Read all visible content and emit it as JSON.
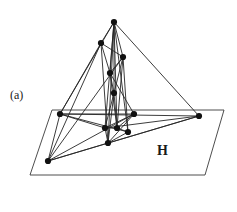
{
  "figure": {
    "caption_label": "(a)",
    "plane_label": "H",
    "title": "",
    "colors": {
      "stroke": "#262626",
      "node_fill": "#111111",
      "plane_stroke": "#3a3a3a",
      "background": "#ffffff",
      "text": "#1a1a1a"
    },
    "style": {
      "edge_width": 0.9,
      "plane_width": 0.9,
      "node_radius": 3.1
    },
    "canvas": {
      "width": 237,
      "height": 212
    },
    "plane": {
      "name": "H",
      "corners": [
        [
          52,
          110
        ],
        [
          224,
          110
        ],
        [
          205,
          175
        ],
        [
          30,
          175
        ]
      ]
    },
    "nodes": [
      {
        "id": "n0",
        "name": "apex",
        "x": 114,
        "y": 22,
        "on_plane": false
      },
      {
        "id": "n1",
        "name": "upper-left",
        "x": 101,
        "y": 43,
        "on_plane": false
      },
      {
        "id": "n2",
        "name": "upper-right",
        "x": 123,
        "y": 57,
        "on_plane": false
      },
      {
        "id": "n3",
        "name": "mid-upper",
        "x": 110,
        "y": 73,
        "on_plane": false
      },
      {
        "id": "n4",
        "name": "mid-lower",
        "x": 114,
        "y": 93,
        "on_plane": false
      },
      {
        "id": "n5",
        "name": "plane-left",
        "x": 60,
        "y": 114,
        "on_plane": true
      },
      {
        "id": "n6",
        "name": "plane-center",
        "x": 134,
        "y": 114,
        "on_plane": true
      },
      {
        "id": "n7",
        "name": "plane-right",
        "x": 199,
        "y": 116,
        "on_plane": true
      },
      {
        "id": "n8",
        "name": "cluster-left",
        "x": 105,
        "y": 128,
        "on_plane": true
      },
      {
        "id": "n9",
        "name": "cluster-mid",
        "x": 117,
        "y": 128,
        "on_plane": true
      },
      {
        "id": "n10",
        "name": "cluster-right",
        "x": 128,
        "y": 132,
        "on_plane": true
      },
      {
        "id": "n11",
        "name": "cluster-bottom",
        "x": 108,
        "y": 143,
        "on_plane": true
      },
      {
        "id": "n12",
        "name": "plane-lower-left",
        "x": 48,
        "y": 161,
        "on_plane": true
      }
    ],
    "edges": [
      [
        "n0",
        "n1"
      ],
      [
        "n0",
        "n2"
      ],
      [
        "n0",
        "n3"
      ],
      [
        "n0",
        "n4"
      ],
      [
        "n0",
        "n8"
      ],
      [
        "n0",
        "n9"
      ],
      [
        "n0",
        "n10"
      ],
      [
        "n0",
        "n11"
      ],
      [
        "n0",
        "n5"
      ],
      [
        "n0",
        "n7"
      ],
      [
        "n1",
        "n2"
      ],
      [
        "n1",
        "n3"
      ],
      [
        "n1",
        "n5"
      ],
      [
        "n1",
        "n11"
      ],
      [
        "n1",
        "n12"
      ],
      [
        "n2",
        "n3"
      ],
      [
        "n2",
        "n4"
      ],
      [
        "n2",
        "n9"
      ],
      [
        "n2",
        "n10"
      ],
      [
        "n2",
        "n12"
      ],
      [
        "n3",
        "n4"
      ],
      [
        "n3",
        "n9"
      ],
      [
        "n3",
        "n6"
      ],
      [
        "n4",
        "n8"
      ],
      [
        "n4",
        "n9"
      ],
      [
        "n4",
        "n11"
      ],
      [
        "n5",
        "n6"
      ],
      [
        "n5",
        "n8"
      ],
      [
        "n5",
        "n10"
      ],
      [
        "n5",
        "n7"
      ],
      [
        "n6",
        "n8"
      ],
      [
        "n6",
        "n9"
      ],
      [
        "n6",
        "n11"
      ],
      [
        "n6",
        "n12"
      ],
      [
        "n7",
        "n8"
      ],
      [
        "n7",
        "n11"
      ],
      [
        "n7",
        "n12"
      ],
      [
        "n8",
        "n9"
      ],
      [
        "n8",
        "n11"
      ],
      [
        "n9",
        "n10"
      ],
      [
        "n10",
        "n11"
      ],
      [
        "n11",
        "n12"
      ],
      [
        "n5",
        "n12"
      ]
    ]
  }
}
